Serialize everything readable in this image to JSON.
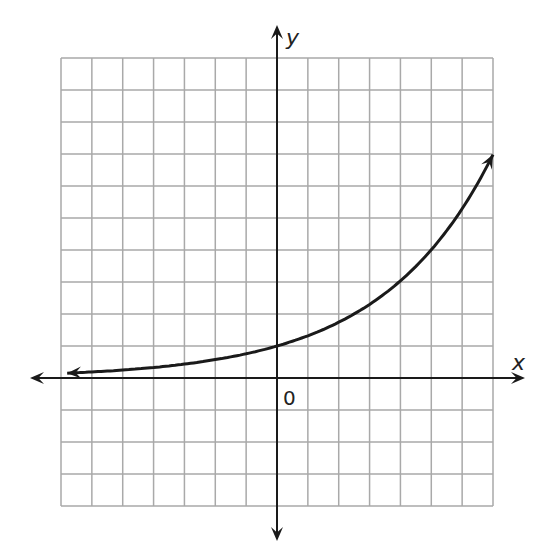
{
  "chart_data": {
    "type": "line",
    "title": "",
    "xlabel": "x",
    "ylabel": "y",
    "origin_label": "0",
    "grid": true,
    "grid_columns": 14,
    "grid_rows": 14,
    "xlim": [
      -7,
      7
    ],
    "ylim": [
      -4,
      10
    ],
    "function_description": "exponential growth curve passing through (0, 1), approx y = 1.32^x",
    "series": [
      {
        "name": "curve",
        "x": [
          -6.8,
          -6,
          -5,
          -4,
          -3,
          -2,
          -1,
          0,
          1,
          2,
          3,
          4,
          5,
          6,
          7
        ],
        "y": [
          0.15,
          0.19,
          0.25,
          0.33,
          0.44,
          0.57,
          0.76,
          1.0,
          1.32,
          1.74,
          2.3,
          3.0,
          4.0,
          5.3,
          7.0
        ],
        "arrow_ends": true
      }
    ],
    "axes_arrows": true
  },
  "colors": {
    "grid": "#a9a9a9",
    "axis": "#1a1a1a",
    "curve": "#1a1a1a"
  },
  "labels": {
    "x_axis": "x",
    "y_axis": "y",
    "origin": "0"
  }
}
